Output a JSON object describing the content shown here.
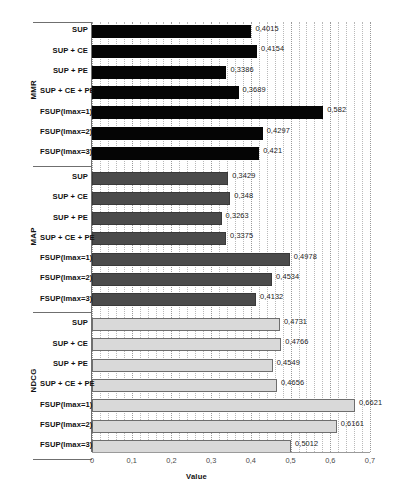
{
  "chart_data": {
    "type": "bar",
    "orientation": "horizontal",
    "title": "",
    "xlabel": "Value",
    "ylabel": "",
    "xlim": [
      0,
      0.7
    ],
    "xticks": [
      "0",
      "0,1",
      "0,2",
      "0,3",
      "0,4",
      "0,5",
      "0,6",
      "0,7"
    ],
    "xtick_values": [
      0,
      0.1,
      0.2,
      0.3,
      0.4,
      0.5,
      0.6,
      0.7
    ],
    "grid": "vertical-minor-dotted",
    "legend": "none",
    "categories": [
      "SUP",
      "SUP + CE",
      "SUP + PE",
      "SUP + CE + PE",
      "FSUP(lmax=1)",
      "FSUP(lmax=2)",
      "FSUP(lmax=3)"
    ],
    "groups": [
      {
        "name": "MMR",
        "color": "#050505",
        "values": [
          0.4015,
          0.4154,
          0.3386,
          0.3689,
          0.582,
          0.4297,
          0.421
        ],
        "labels": [
          "0,4015",
          "0,4154",
          "0,3386",
          "0,3689",
          "0,582",
          "0,4297",
          "0,421"
        ]
      },
      {
        "name": "MAP",
        "color": "#4b4b4b",
        "values": [
          0.3429,
          0.348,
          0.3263,
          0.3375,
          0.4978,
          0.4534,
          0.4132
        ],
        "labels": [
          "0,3429",
          "0,348",
          "0,3263",
          "0,3375",
          "0,4978",
          "0,4534",
          "0,4132"
        ]
      },
      {
        "name": "NDCG",
        "color": "#d9d9d9",
        "values": [
          0.4731,
          0.4766,
          0.4549,
          0.4656,
          0.6621,
          0.6161,
          0.5012
        ],
        "labels": [
          "0,4731",
          "0,4766",
          "0,4549",
          "0,4656",
          "0,6621",
          "0,6161",
          "0,5012"
        ]
      }
    ]
  }
}
